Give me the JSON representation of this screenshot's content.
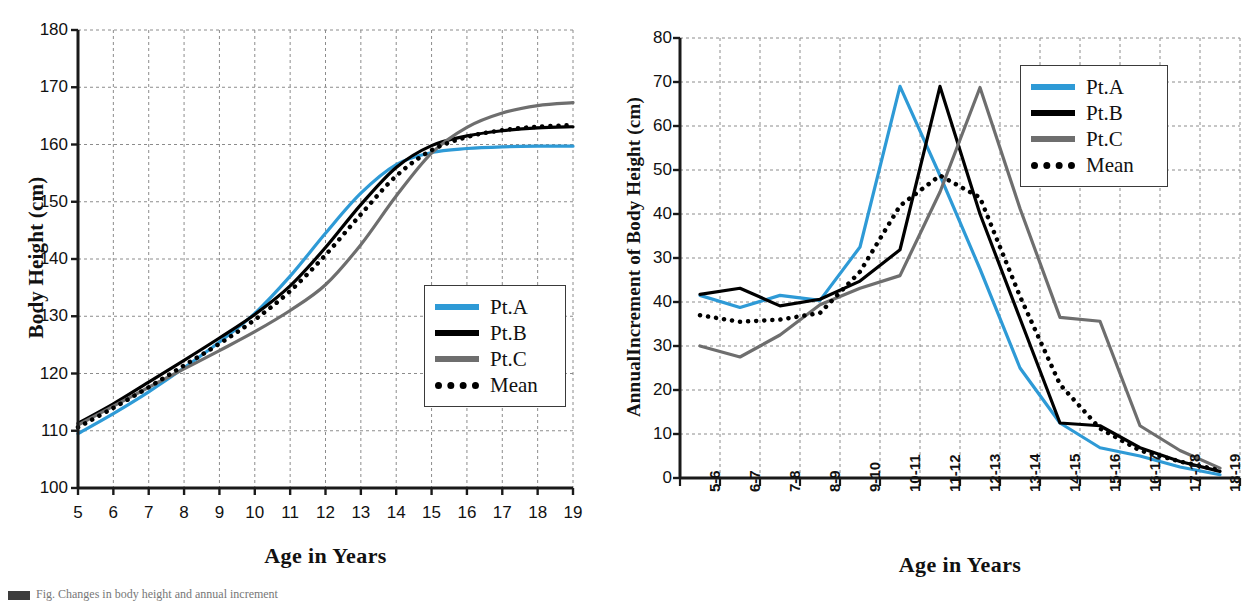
{
  "figure": {
    "background": "#ffffff",
    "colors": {
      "pt_a": "#2e9ad6",
      "pt_b": "#000000",
      "pt_c": "#6e6e6e",
      "mean": "#000000",
      "axis": "#1a1a1a",
      "grid": "#8c8c8c"
    },
    "caption_fragment": "Fig. Changes in body height and annual increment"
  },
  "legend_common": {
    "entries": [
      {
        "label": "Pt.A",
        "color": "#2e9ad6",
        "style": "solid"
      },
      {
        "label": "Pt.B",
        "color": "#000000",
        "style": "solid"
      },
      {
        "label": "Pt.C",
        "color": "#6e6e6e",
        "style": "solid"
      },
      {
        "label": "Mean",
        "color": "#000000",
        "style": "dotted"
      }
    ]
  },
  "chart_data": [
    {
      "id": "body-height",
      "type": "line",
      "title": "",
      "xlabel": "Age in Years",
      "ylabel": "Body Height (cm)",
      "grid": true,
      "legend_position": "bottom-right-inside",
      "xlim": [
        5,
        19
      ],
      "ylim": [
        100,
        180
      ],
      "yticks": [
        100,
        110,
        120,
        130,
        140,
        150,
        160,
        170,
        180
      ],
      "x": [
        5,
        6,
        7,
        8,
        9,
        10,
        11,
        12,
        13,
        14,
        15,
        16,
        17,
        18,
        19
      ],
      "xticklabels": [
        "5",
        "6",
        "7",
        "8",
        "9",
        "10",
        "11",
        "12",
        "13",
        "14",
        "15",
        "16",
        "17",
        "18",
        "19"
      ],
      "series": [
        {
          "name": "Pt.A",
          "color": "#2e9ad6",
          "style": "solid",
          "values": [
            109.5,
            113.0,
            116.8,
            121.0,
            125.5,
            130.5,
            137.0,
            144.5,
            151.5,
            156.5,
            158.6,
            159.3,
            159.6,
            159.7,
            159.7
          ]
        },
        {
          "name": "Pt.B",
          "color": "#000000",
          "style": "solid",
          "values": [
            111.3,
            114.7,
            118.5,
            122.3,
            126.2,
            130.3,
            135.3,
            142.0,
            149.5,
            156.0,
            159.8,
            161.5,
            162.4,
            162.9,
            163.1
          ]
        },
        {
          "name": "Pt.C",
          "color": "#6e6e6e",
          "style": "solid",
          "values": [
            111.0,
            114.3,
            117.6,
            120.8,
            124.0,
            127.3,
            131.0,
            135.5,
            142.5,
            151.0,
            158.5,
            163.0,
            165.5,
            166.8,
            167.3
          ]
        },
        {
          "name": "Mean",
          "color": "#000000",
          "style": "dotted",
          "values": [
            110.6,
            114.0,
            117.6,
            121.4,
            125.2,
            129.4,
            134.4,
            140.7,
            147.8,
            154.5,
            159.0,
            161.3,
            162.5,
            163.1,
            163.4
          ]
        }
      ]
    },
    {
      "id": "annual-increment",
      "type": "line",
      "title": "",
      "xlabel": "Age in Years",
      "ylabel": "AnnualIncrement of Body Height (cm)",
      "grid": true,
      "legend_position": "top-right-inside",
      "ylim": [
        0,
        80
      ],
      "ytick_positions": [
        80,
        72,
        64,
        56,
        48,
        40,
        32,
        24,
        16,
        8,
        0
      ],
      "yticklabels": [
        "80",
        "70",
        "60",
        "50",
        "40",
        "30",
        "40",
        "30",
        "20",
        "10",
        "0"
      ],
      "x_index": [
        0,
        1,
        2,
        3,
        4,
        5,
        6,
        7,
        8,
        9,
        10,
        11,
        12,
        13
      ],
      "xticklabels": [
        "5-6",
        "6-7",
        "7-8",
        "8-9",
        "9-10",
        "10-11",
        "11-12",
        "12-13",
        "13-14",
        "14-15",
        "15-16",
        "16-17",
        "17-18",
        "18-19"
      ],
      "series": [
        {
          "name": "Pt.A",
          "color": "#2e9ad6",
          "style": "solid",
          "values": [
            33.2,
            31.0,
            33.2,
            32.3,
            42.0,
            71.2,
            55.0,
            38.0,
            20.0,
            10.0,
            5.5,
            4.0,
            2.0,
            0.6
          ]
        },
        {
          "name": "Pt.B",
          "color": "#000000",
          "style": "solid",
          "values": [
            33.4,
            34.5,
            31.3,
            32.5,
            35.8,
            41.5,
            71.2,
            48.0,
            29.0,
            10.0,
            9.5,
            5.5,
            3.0,
            1.2
          ]
        },
        {
          "name": "Pt.C",
          "color": "#6e6e6e",
          "style": "solid",
          "values": [
            24.0,
            22.0,
            26.0,
            31.5,
            34.5,
            36.8,
            52.0,
            71.0,
            49.0,
            29.2,
            28.5,
            9.5,
            5.0,
            1.8
          ]
        },
        {
          "name": "Mean",
          "color": "#000000",
          "style": "dotted",
          "values": [
            29.6,
            28.4,
            28.8,
            30.0,
            37.5,
            49.5,
            55.0,
            51.0,
            33.0,
            17.0,
            9.0,
            5.0,
            3.0,
            1.4
          ]
        }
      ]
    }
  ]
}
